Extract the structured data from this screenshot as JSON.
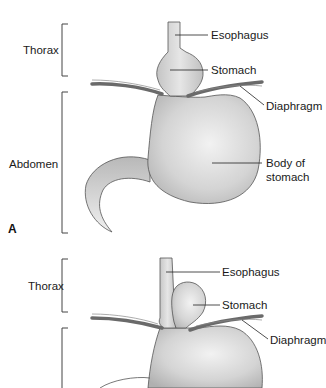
{
  "figure": {
    "colors": {
      "organ_fill_light": "#e4e4e4",
      "organ_fill_dark": "#b8b8b8",
      "outline": "#555555",
      "diaphragm": "#6a6a6a",
      "leader_line": "#222222",
      "text": "#1a1a1a"
    },
    "panels": [
      {
        "letter": "A",
        "regions": {
          "upper": "Thorax",
          "lower": "Abdomen"
        },
        "labels": {
          "esophagus": "Esophagus",
          "stomach": "Stomach",
          "diaphragm": "Diaphragm",
          "body_of_stomach_line1": "Body of",
          "body_of_stomach_line2": "stomach"
        }
      },
      {
        "letter": "",
        "regions": {
          "upper": "Thorax"
        },
        "labels": {
          "esophagus": "Esophagus",
          "stomach": "Stomach",
          "diaphragm": "Diaphragm"
        }
      }
    ]
  }
}
